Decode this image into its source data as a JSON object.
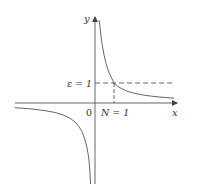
{
  "diagram": {
    "axes": {
      "x_label": "x",
      "y_label": "y",
      "origin_label": "0"
    },
    "annotations": {
      "epsilon_label": "ε = 1",
      "n_label": "N = 1"
    },
    "function": "y = 1/x",
    "epsilon_value": 1,
    "N_value": 1,
    "colors": {
      "line": "#555555",
      "background": "#ffffff"
    }
  }
}
